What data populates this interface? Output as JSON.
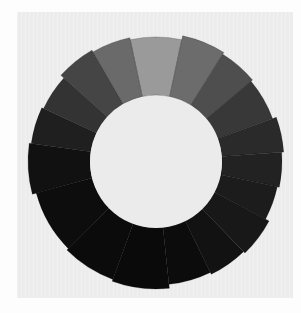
{
  "image": {
    "subject": "grayscale value wheel made of painted swatches",
    "background_color": "#fdfdfd",
    "panel_color": "#ececec",
    "hole_color": "#ebebeb",
    "ring": {
      "center": [
        156,
        161
      ],
      "outer_radius": 128,
      "inner_radius": 66
    },
    "swatches": [
      {
        "start": -102,
        "end": -78,
        "color": "#9a9a9a"
      },
      {
        "start": -78,
        "end": -58,
        "color": "#6c6c6c"
      },
      {
        "start": -58,
        "end": -40,
        "color": "#4e4e4e"
      },
      {
        "start": -40,
        "end": -20,
        "color": "#383838"
      },
      {
        "start": -20,
        "end": -4,
        "color": "#2a2a2a"
      },
      {
        "start": -4,
        "end": 12,
        "color": "#222222"
      },
      {
        "start": 12,
        "end": 28,
        "color": "#1c1c1c"
      },
      {
        "start": 28,
        "end": 46,
        "color": "#181818"
      },
      {
        "start": 46,
        "end": 64,
        "color": "#121212"
      },
      {
        "start": 64,
        "end": 84,
        "color": "#0c0c0c"
      },
      {
        "start": 84,
        "end": 110,
        "color": "#0a0a0a"
      },
      {
        "start": 110,
        "end": 135,
        "color": "#0b0b0b"
      },
      {
        "start": 135,
        "end": 165,
        "color": "#0d0d0d"
      },
      {
        "start": 165,
        "end": 188,
        "color": "#111111"
      },
      {
        "start": 188,
        "end": 205,
        "color": "#1f1f1f"
      },
      {
        "start": 205,
        "end": 222,
        "color": "#333333"
      },
      {
        "start": 222,
        "end": 240,
        "color": "#454545"
      },
      {
        "start": 240,
        "end": 258,
        "color": "#6a6a6a"
      }
    ]
  }
}
